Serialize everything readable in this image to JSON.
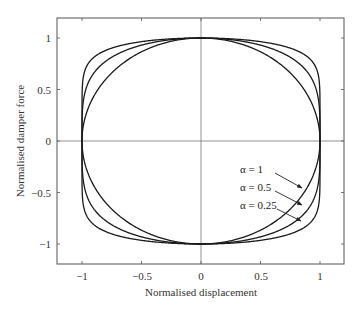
{
  "chart_data": {
    "type": "line",
    "title": "",
    "xlabel": "Normalised displacement",
    "ylabel": "Normalised damper force",
    "xlim": [
      -1.2,
      1.2
    ],
    "ylim": [
      -1.2,
      1.2
    ],
    "xticks": [
      "-1",
      "-0.5",
      "0",
      "0.5",
      "1"
    ],
    "yticks": [
      "1",
      "0.5",
      "0",
      "-0.5",
      "-1"
    ],
    "grid": false,
    "zero_lines": true,
    "series": [
      {
        "name": "α = 1",
        "alpha": 1,
        "shape": "circle: F = ±sqrt(1 - x^2)"
      },
      {
        "name": "α = 0.5",
        "alpha": 0.5,
        "shape": "F = ±(1 - x^2)^0.25"
      },
      {
        "name": "α = 0.25",
        "alpha": 0.25,
        "shape": "F = ±(1 - x^2)^0.125"
      }
    ],
    "annotations": [
      {
        "text": "α = 1",
        "arrow_to": [
          0.86,
          -0.47
        ]
      },
      {
        "text": "α = 0.5",
        "arrow_to": [
          0.86,
          -0.62
        ]
      },
      {
        "text": "α = 0.25",
        "arrow_to": [
          0.85,
          -0.78
        ]
      }
    ]
  },
  "axes": {
    "xlabel": "Normalised displacement",
    "ylabel": "Normalised damper force",
    "xticks": [
      {
        "label": "−1",
        "v": -1
      },
      {
        "label": "−0.5",
        "v": -0.5
      },
      {
        "label": "0",
        "v": 0
      },
      {
        "label": "0.5",
        "v": 0.5
      },
      {
        "label": "1",
        "v": 1
      }
    ],
    "yticks": [
      {
        "label": "1",
        "v": 1
      },
      {
        "label": "0.5",
        "v": 0.5
      },
      {
        "label": "0",
        "v": 0
      },
      {
        "label": "−0.5",
        "v": -0.5
      },
      {
        "label": "−1",
        "v": -1
      }
    ]
  },
  "legend": {
    "a1": "α = 1",
    "a05": "α = 0.5",
    "a025": "α = 0.25"
  }
}
